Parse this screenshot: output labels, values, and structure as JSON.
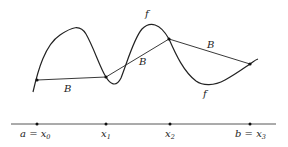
{
  "diagram": {
    "curve_label": "f",
    "broken_line_label": "B",
    "axis_labels": [
      {
        "main": "a = x",
        "sub": "0"
      },
      {
        "main": "x",
        "sub": "1"
      },
      {
        "main": "x",
        "sub": "2"
      },
      {
        "main": "b = x",
        "sub": "3"
      }
    ],
    "colors": {
      "stroke": "#222222",
      "background": "#ffffff"
    }
  }
}
